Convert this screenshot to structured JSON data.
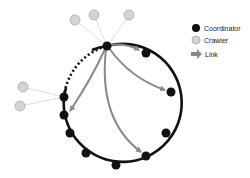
{
  "diagram": {
    "ring": {
      "cx": 118,
      "cy": 106,
      "r": 59,
      "color": "#111111"
    },
    "coordinators": [
      {
        "id": "c0",
        "x": 107,
        "y": 46
      },
      {
        "id": "c1",
        "x": 146,
        "y": 53
      },
      {
        "id": "c2",
        "x": 171,
        "y": 92
      },
      {
        "id": "c3",
        "x": 166,
        "y": 133
      },
      {
        "id": "c4",
        "x": 146,
        "y": 156
      },
      {
        "id": "c5",
        "x": 116,
        "y": 165
      },
      {
        "id": "c6",
        "x": 86,
        "y": 153
      },
      {
        "id": "c7",
        "x": 70,
        "y": 133
      },
      {
        "id": "c8",
        "x": 64,
        "y": 115
      },
      {
        "id": "c9",
        "x": 64,
        "y": 97
      }
    ],
    "crawlers": [
      {
        "id": "w0",
        "x": 75,
        "y": 20,
        "attached_to": "c0"
      },
      {
        "id": "w1",
        "x": 94,
        "y": 15,
        "attached_to": "c0"
      },
      {
        "id": "w2",
        "x": 129,
        "y": 15,
        "attached_to": "c0"
      },
      {
        "id": "w3",
        "x": 23,
        "y": 87,
        "attached_to": "c9"
      },
      {
        "id": "w4",
        "x": 20,
        "y": 106,
        "attached_to": "c9"
      }
    ],
    "links": [
      {
        "from": "c0",
        "to": "c1"
      },
      {
        "from": "c0",
        "to": "c2"
      },
      {
        "from": "c0",
        "to": "c4"
      },
      {
        "from": "c0",
        "to": "c8"
      }
    ],
    "colors": {
      "coordinator": "#111111",
      "crawler_fill": "#d4d4d4",
      "crawler_stroke": "#a8a8a8",
      "link": "#8a8a8a",
      "crawler_edge": "#d0d0d0"
    }
  },
  "legend": {
    "items": [
      {
        "label": "Coordinator",
        "icon": "black-circle"
      },
      {
        "label": "Crawler",
        "icon": "gray-circle"
      },
      {
        "label": "Link",
        "icon": "gray-arrow"
      }
    ]
  }
}
